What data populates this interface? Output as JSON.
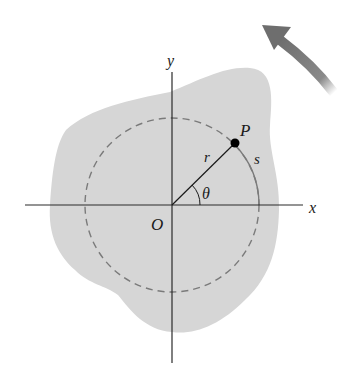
{
  "diagram": {
    "labels": {
      "x_axis": "x",
      "y_axis": "y",
      "origin": "O",
      "point": "P",
      "radius": "r",
      "angle": "θ",
      "arc_length": "s"
    },
    "colors": {
      "body_fill": "#d6d6d6",
      "axis": "#2a2a2a",
      "dashed_circle": "#7a7a7a",
      "arrow": "#7d7d7d",
      "point": "#000000"
    },
    "rotation_direction": "counterclockwise"
  }
}
